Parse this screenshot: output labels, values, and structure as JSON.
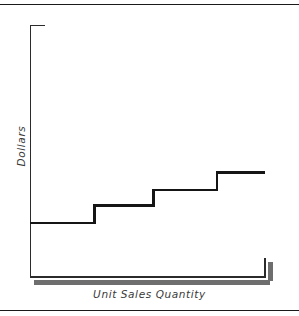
{
  "chart_data": {
    "type": "line",
    "subtype": "step",
    "title": "",
    "xlabel": "Unit Sales Quantity",
    "ylabel": "Dollars",
    "grid": false,
    "legend": null,
    "xlim": [
      0,
      100
    ],
    "ylim": [
      0,
      100
    ],
    "axis_ticks": {
      "x": [],
      "y": []
    },
    "steps": [
      {
        "index": 1,
        "x_start": 0,
        "x_end": 27,
        "y": 22
      },
      {
        "index": 2,
        "x_start": 27,
        "x_end": 52,
        "y": 29
      },
      {
        "index": 3,
        "x_start": 52,
        "x_end": 79,
        "y": 35
      },
      {
        "index": 4,
        "x_start": 79,
        "x_end": 100,
        "y": 42
      }
    ],
    "x": [
      0,
      27,
      27,
      52,
      52,
      79,
      79,
      100
    ],
    "values": [
      22,
      22,
      29,
      29,
      35,
      35,
      42,
      42
    ],
    "series": [
      {
        "name": "Step cost",
        "x": [
          0,
          27,
          27,
          52,
          52,
          79,
          79,
          100
        ],
        "values": [
          22,
          22,
          29,
          29,
          35,
          35,
          42,
          42
        ]
      }
    ]
  },
  "figure": {
    "axis_color": "#2b2b2b",
    "line_color": "#151515",
    "shadow_color": "#6e6e6e",
    "rule_color": "#1a1a1a",
    "background": "#ffffff",
    "label_color": "#3a3a3a"
  },
  "labels": {
    "y_axis": "Dollars",
    "x_axis": "Unit Sales Quantity"
  }
}
